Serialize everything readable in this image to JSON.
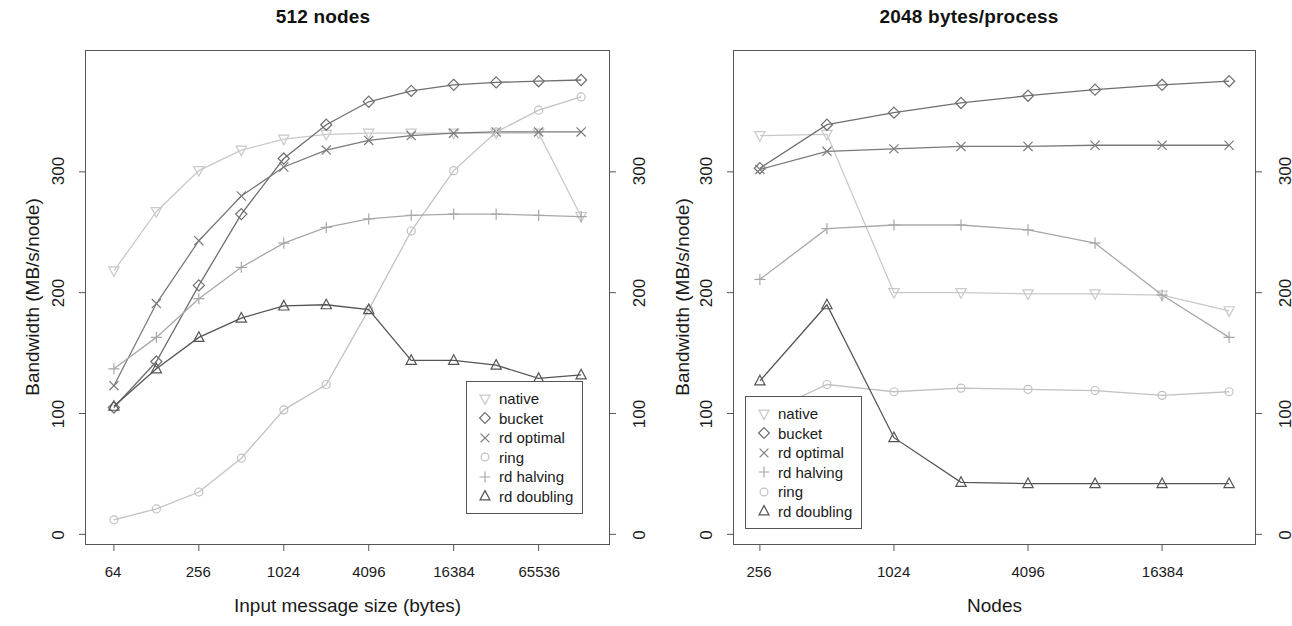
{
  "figure": {
    "background": "#ffffff",
    "text_color": "#1a1a1a"
  },
  "panels": [
    {
      "id": "left",
      "title": "512 nodes",
      "xlabel": "Input message size (bytes)",
      "ylabel": "Bandwidth (MB/s/node)",
      "y_ticks": [
        "0",
        "100",
        "200",
        "300"
      ],
      "y_ticks_right": [
        "0",
        "100",
        "200",
        "300"
      ],
      "x_ticks": [
        "64",
        "256",
        "1024",
        "4096",
        "16384",
        "65536"
      ],
      "legend_items": [
        "native",
        "bucket",
        "rd optimal",
        "ring",
        "rd halving",
        "rd doubling"
      ]
    },
    {
      "id": "right",
      "title": "2048 bytes/process",
      "xlabel": "Nodes",
      "ylabel": "Bandwidth (MB/s/node)",
      "y_ticks": [
        "0",
        "100",
        "200",
        "300"
      ],
      "y_ticks_right": [
        "0",
        "100",
        "200",
        "300"
      ],
      "x_ticks": [
        "256",
        "1024",
        "4096",
        "16384"
      ],
      "legend_items": [
        "native",
        "bucket",
        "rd optimal",
        "rd halving",
        "ring",
        "rd doubling"
      ]
    }
  ],
  "chart_data": [
    {
      "type": "line",
      "title": "512 nodes",
      "xlabel": "Input message size (bytes)",
      "ylabel": "Bandwidth (MB/s/node)",
      "x_scale": "log2",
      "x": [
        64,
        128,
        256,
        512,
        1024,
        2048,
        4096,
        8192,
        16384,
        32768,
        65536,
        131072
      ],
      "x_tick_values": [
        64,
        256,
        1024,
        4096,
        16384,
        65536
      ],
      "x_tick_labels": [
        "64",
        "256",
        "1024",
        "4096",
        "16384",
        "65536"
      ],
      "y_tick_values": [
        0,
        100,
        200,
        300
      ],
      "y_tick_labels": [
        "0",
        "100",
        "200",
        "300"
      ],
      "ylim": [
        -8,
        400
      ],
      "grid": false,
      "legend_position": "bottom-right",
      "series": [
        {
          "name": "native",
          "symbol": "triangle-down",
          "color": "#c9c9c9",
          "values": [
            218,
            267,
            301,
            318,
            327,
            331,
            332,
            332,
            332,
            332,
            332,
            263
          ]
        },
        {
          "name": "bucket",
          "symbol": "diamond",
          "color": "#6f6f6f",
          "values": [
            105,
            143,
            206,
            265,
            311,
            339,
            358,
            367,
            372,
            374,
            375,
            376
          ]
        },
        {
          "name": "rd optimal",
          "symbol": "cross",
          "color": "#7a7a7a",
          "values": [
            123,
            191,
            243,
            280,
            304,
            318,
            326,
            330,
            332,
            333,
            333,
            333
          ]
        },
        {
          "name": "ring",
          "symbol": "circle",
          "color": "#c2c2c2",
          "values": [
            12,
            21,
            35,
            63,
            103,
            124,
            186,
            251,
            301,
            333,
            351,
            362
          ]
        },
        {
          "name": "rd halving",
          "symbol": "plus",
          "color": "#a8a8a8",
          "values": [
            137,
            163,
            195,
            221,
            241,
            254,
            261,
            264,
            265,
            265,
            264,
            263
          ]
        },
        {
          "name": "rd doubling",
          "symbol": "triangle-up",
          "color": "#555555",
          "values": [
            106,
            137,
            163,
            179,
            189,
            190,
            186,
            144,
            144,
            140,
            129,
            132
          ]
        }
      ]
    },
    {
      "type": "line",
      "title": "2048 bytes/process",
      "xlabel": "Nodes",
      "ylabel": "Bandwidth (MB/s/node)",
      "x_scale": "log2",
      "x": [
        256,
        512,
        1024,
        2048,
        4096,
        8192,
        16384,
        32768
      ],
      "x_tick_values": [
        256,
        1024,
        4096,
        16384
      ],
      "x_tick_labels": [
        "256",
        "1024",
        "4096",
        "16384"
      ],
      "y_tick_values": [
        0,
        100,
        200,
        300
      ],
      "y_tick_labels": [
        "0",
        "100",
        "200",
        "300"
      ],
      "ylim": [
        -8,
        400
      ],
      "grid": false,
      "legend_position": "bottom-left",
      "series": [
        {
          "name": "native",
          "symbol": "triangle-down",
          "color": "#c9c9c9",
          "values": [
            330,
            331,
            200,
            200,
            199,
            199,
            198,
            185
          ]
        },
        {
          "name": "bucket",
          "symbol": "diamond",
          "color": "#6f6f6f",
          "values": [
            303,
            339,
            349,
            357,
            363,
            368,
            372,
            375
          ]
        },
        {
          "name": "rd optimal",
          "symbol": "cross",
          "color": "#7a7a7a",
          "values": [
            302,
            317,
            319,
            321,
            321,
            322,
            322,
            322
          ]
        },
        {
          "name": "rd halving",
          "symbol": "plus",
          "color": "#a8a8a8",
          "values": [
            211,
            253,
            256,
            256,
            252,
            241,
            198,
            163
          ]
        },
        {
          "name": "ring",
          "symbol": "circle",
          "color": "#c2c2c2",
          "values": [
            98,
            124,
            118,
            121,
            120,
            119,
            115,
            118
          ]
        },
        {
          "name": "rd doubling",
          "symbol": "triangle-up",
          "color": "#555555",
          "values": [
            127,
            190,
            80,
            43,
            42,
            42,
            42,
            42
          ]
        }
      ]
    }
  ]
}
